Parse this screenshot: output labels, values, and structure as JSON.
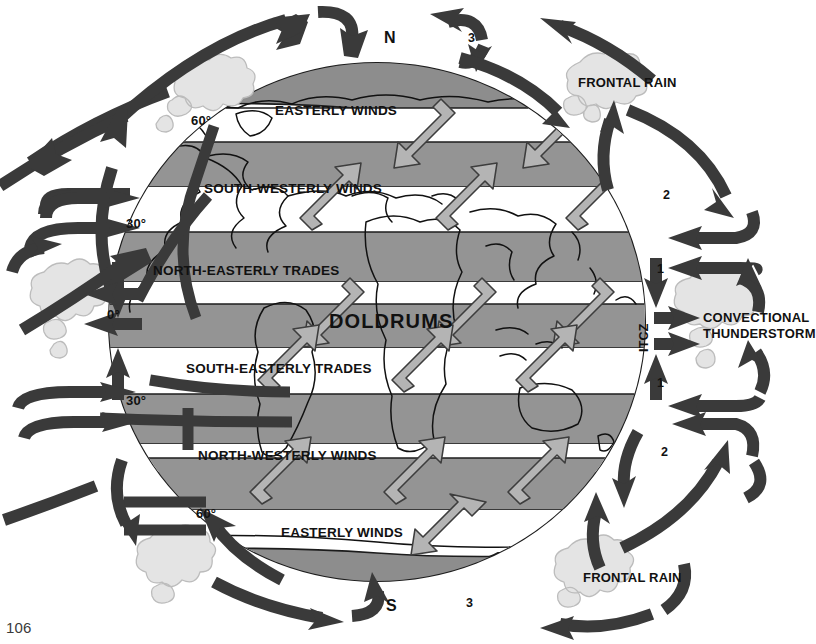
{
  "figure": {
    "page_number": "106"
  },
  "poles": {
    "north": "N",
    "south": "S"
  },
  "latitudes": {
    "north_60": "60°",
    "north_30": "30°",
    "equator": "0°",
    "south_30": "30°",
    "south_60": "60°"
  },
  "wind_belts": [
    {
      "id": "n-polar-easterlies",
      "label": "EASTERLY WINDS"
    },
    {
      "id": "n-south-westerlies",
      "label": "SOUTH-WESTERLY WINDS"
    },
    {
      "id": "n-east-trades",
      "label": "NORTH-EASTERLY TRADES"
    },
    {
      "id": "doldrums",
      "label": "DOLDRUMS"
    },
    {
      "id": "s-east-trades",
      "label": "SOUTH-EASTERLY TRADES"
    },
    {
      "id": "s-north-westerlies",
      "label": "NORTH-WESTERLY WINDS"
    },
    {
      "id": "s-polar-easterlies",
      "label": "EASTERLY WINDS"
    }
  ],
  "convergence_zone": {
    "label": "ITCZ"
  },
  "weather": {
    "frontal_rain_north": "FRONTAL RAIN",
    "frontal_rain_south": "FRONTAL RAIN",
    "thunderstorm_line1": "CONVECTIONAL",
    "thunderstorm_line2": "THUNDERSTORM"
  },
  "cells": {
    "hadley_north": "1",
    "hadley_south": "1",
    "ferrel_north": "2",
    "ferrel_south": "2",
    "polar_north": "3",
    "polar_south": "3"
  },
  "colors": {
    "band_shaded": "#949494",
    "band_light": "#ffffff",
    "cap_shaded": "#8d8d8d",
    "arrow_dark": "#3a3a3a",
    "arrow_band_fill": "#b4b4b4",
    "arrow_band_stroke": "#3d3d3d",
    "cloud": "#e2e2e2",
    "cloud_stroke": "#b9b9b9",
    "outline": "#1c1c1c",
    "text": "#111111",
    "background": "#ffffff"
  }
}
